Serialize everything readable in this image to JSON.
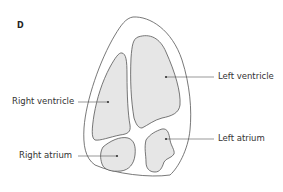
{
  "panel_letter": "D",
  "labels": {
    "left_ventricle": "Left ventricle",
    "right_ventricle": "Right ventricle",
    "left_atrium": "Left atrium",
    "right_atrium": "Right atrium"
  },
  "colors": {
    "chamber_fill": "#e6e6e6",
    "outline": "#555555",
    "text": "#333333"
  }
}
